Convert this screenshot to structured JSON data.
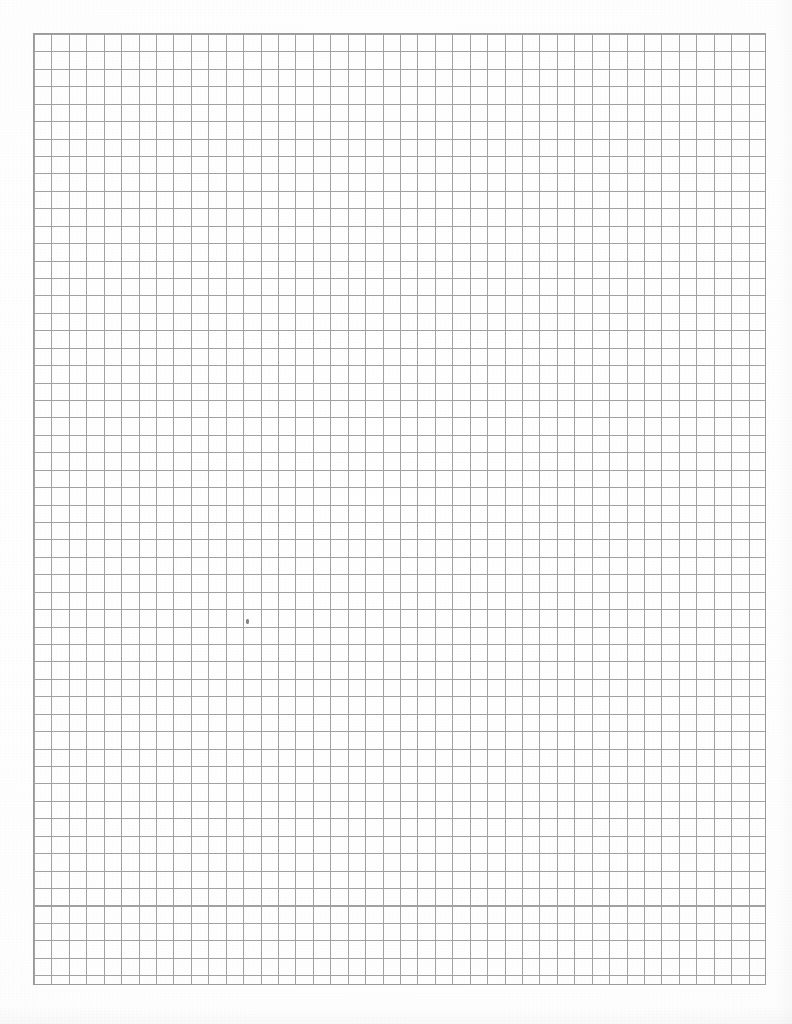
{
  "page": {
    "width": 792,
    "height": 1024,
    "background_color": "#fefefe",
    "paper_tone": "#fbfbfb"
  },
  "grid": {
    "description": "Quadrille / quad-ruled graph paper, uniform square cells, no bold major lines",
    "origin_x": 33,
    "origin_y": 33,
    "right_edge": 764,
    "bottom_edge": 983,
    "width": 731,
    "height": 950,
    "cell_size_px": 17.43,
    "columns": 42,
    "rows": 54.5,
    "line_color": "#9a9a9a",
    "line_width_px": 1,
    "major_lines": false,
    "border_visible": true
  },
  "marks": [
    {
      "name": "pencil-speck",
      "x": 246,
      "y": 619,
      "width": 3,
      "height": 5,
      "color": "#6f6f6f"
    }
  ],
  "chart_data": {
    "type": "table",
    "xlabel": "",
    "ylabel": "",
    "categories": [],
    "values": [],
    "grid": true,
    "legend": "none"
  }
}
